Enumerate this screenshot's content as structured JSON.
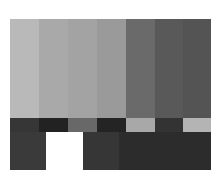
{
  "pattern": {
    "name": "grayscale color bars test pattern",
    "top_bars": [
      {
        "name": "bar-1",
        "width": 29,
        "color": "#b9b9b9"
      },
      {
        "name": "bar-2",
        "width": 29,
        "color": "#a9a9a9"
      },
      {
        "name": "bar-3",
        "width": 29,
        "color": "#a3a3a3"
      },
      {
        "name": "bar-4",
        "width": 29,
        "color": "#9a9a9a"
      },
      {
        "name": "bar-5",
        "width": 29,
        "color": "#6a6a6a"
      },
      {
        "name": "bar-6",
        "width": 28,
        "color": "#595959"
      },
      {
        "name": "bar-7",
        "width": 28,
        "color": "#545454"
      }
    ],
    "middle_strip": [
      {
        "name": "strip-1",
        "width": 29,
        "color": "#363636"
      },
      {
        "name": "strip-2",
        "width": 29,
        "color": "#222222"
      },
      {
        "name": "strip-3",
        "width": 29,
        "color": "#686868"
      },
      {
        "name": "strip-4",
        "width": 29,
        "color": "#242424"
      },
      {
        "name": "strip-5",
        "width": 29,
        "color": "#a8a8a8"
      },
      {
        "name": "strip-6",
        "width": 28,
        "color": "#333333"
      },
      {
        "name": "strip-7",
        "width": 28,
        "color": "#b4b4b4"
      }
    ],
    "bottom_blocks": [
      {
        "name": "pluge-dark-1",
        "width": 36,
        "color": "#3a3a3a"
      },
      {
        "name": "white-block",
        "width": 37,
        "color": "#ffffff"
      },
      {
        "name": "pluge-dark-2",
        "width": 36,
        "color": "#363636"
      },
      {
        "name": "black-block",
        "width": 92,
        "color": "#2c2c2c"
      }
    ]
  }
}
